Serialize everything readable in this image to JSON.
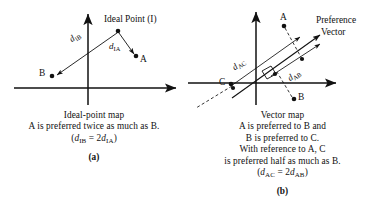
{
  "figure": {
    "title_implicit": "Ideal-point map and Vector map comparison",
    "background_color": "#ffffff",
    "ink_color": "#111111"
  },
  "panel_a": {
    "letter": "(a)",
    "caption_lines": [
      "Ideal-point map",
      "A is preferred twice as much as B."
    ],
    "formula": {
      "open": "(",
      "d1": "d",
      "d1_sub": "IB",
      "equals": " = 2",
      "d2": "d",
      "d2_sub": "IA",
      "close": ")"
    },
    "labels": {
      "ideal_point": "Ideal Point (I)",
      "point_a": "A",
      "point_b": "B",
      "dist_ib": {
        "symbol": "d",
        "sub": "IB"
      },
      "dist_ia": {
        "symbol": "d",
        "sub": "IA"
      }
    },
    "geometry": {
      "origin": [
        88,
        88
      ],
      "ideal_point": [
        118,
        31
      ],
      "point_a": [
        136,
        56
      ],
      "point_b": [
        52,
        76
      ]
    }
  },
  "panel_b": {
    "letter": "(b)",
    "caption_lines": [
      "Vector map",
      "A is preferred to B and",
      "B is preferred to C.",
      "With reference to A, C",
      "is preferred half as much as B."
    ],
    "formula": {
      "open": "(",
      "d1": "d",
      "d1_sub": "AC",
      "equals": " = 2",
      "d2": "d",
      "d2_sub": "AB",
      "close": ")"
    },
    "labels": {
      "point_a": "A",
      "point_b": "B",
      "point_c": "C",
      "preference_vector_line1": "Preference",
      "preference_vector_line2": "Vector",
      "dist_ac": {
        "symbol": "d",
        "sub": "AC"
      },
      "dist_ab": {
        "symbol": "d",
        "sub": "AB"
      }
    },
    "geometry": {
      "origin": [
        68,
        83
      ],
      "point_a": [
        98,
        25
      ],
      "point_b": [
        105,
        100
      ],
      "point_c": [
        42,
        85
      ]
    }
  }
}
